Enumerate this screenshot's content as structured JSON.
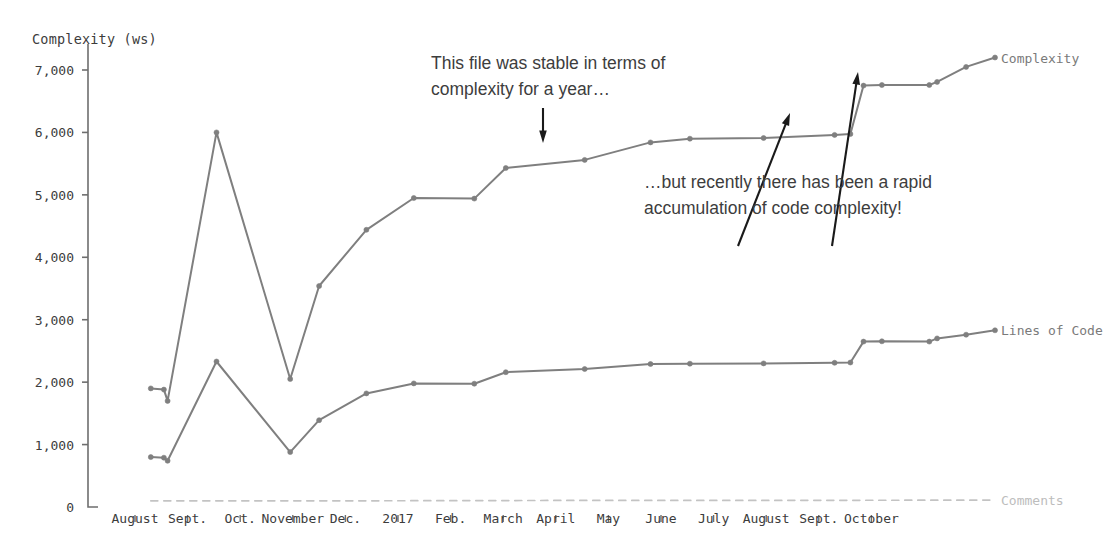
{
  "chart_data": {
    "type": "line",
    "title": "",
    "ylabel": "Complexity (ws)",
    "xlabel": "",
    "ylim": [
      0,
      7600
    ],
    "yticks": [
      0,
      1000,
      2000,
      3000,
      4000,
      5000,
      6000,
      7000
    ],
    "ytick_labels": [
      "0",
      "1,000",
      "2,000",
      "3,000",
      "4,000",
      "5,000",
      "6,000",
      "7,000"
    ],
    "categories": [
      "August",
      "Sept.",
      "Oct.",
      "November",
      "Dec.",
      "2017",
      "Feb.",
      "March",
      "April",
      "May",
      "June",
      "July",
      "August",
      "Sept.",
      "October"
    ],
    "grid": false,
    "legend_position": "right-inline",
    "series": [
      {
        "name": "Complexity",
        "color": "#7f7f7f",
        "style": "solid",
        "markers": true,
        "points": [
          {
            "x": 0.3,
            "y": 1900
          },
          {
            "x": 0.55,
            "y": 1880
          },
          {
            "x": 0.62,
            "y": 1700
          },
          {
            "x": 1.55,
            "y": 6000
          },
          {
            "x": 2.95,
            "y": 2050
          },
          {
            "x": 3.5,
            "y": 3540
          },
          {
            "x": 4.4,
            "y": 4440
          },
          {
            "x": 5.3,
            "y": 4950
          },
          {
            "x": 6.45,
            "y": 4940
          },
          {
            "x": 7.05,
            "y": 5430
          },
          {
            "x": 8.55,
            "y": 5560
          },
          {
            "x": 9.8,
            "y": 5840
          },
          {
            "x": 10.55,
            "y": 5900
          },
          {
            "x": 11.95,
            "y": 5910
          },
          {
            "x": 13.3,
            "y": 5960
          },
          {
            "x": 13.6,
            "y": 5975
          },
          {
            "x": 13.85,
            "y": 6750
          },
          {
            "x": 14.2,
            "y": 6760
          },
          {
            "x": 15.1,
            "y": 6760
          },
          {
            "x": 15.25,
            "y": 6810
          },
          {
            "x": 15.8,
            "y": 7050
          },
          {
            "x": 16.35,
            "y": 7200
          }
        ]
      },
      {
        "name": "Lines of Code",
        "color": "#7f7f7f",
        "style": "solid",
        "markers": true,
        "points": [
          {
            "x": 0.3,
            "y": 800
          },
          {
            "x": 0.55,
            "y": 790
          },
          {
            "x": 0.62,
            "y": 740
          },
          {
            "x": 1.55,
            "y": 2330
          },
          {
            "x": 2.95,
            "y": 880
          },
          {
            "x": 3.5,
            "y": 1390
          },
          {
            "x": 4.4,
            "y": 1820
          },
          {
            "x": 5.3,
            "y": 1980
          },
          {
            "x": 6.45,
            "y": 1975
          },
          {
            "x": 7.05,
            "y": 2160
          },
          {
            "x": 8.55,
            "y": 2210
          },
          {
            "x": 9.8,
            "y": 2290
          },
          {
            "x": 10.55,
            "y": 2295
          },
          {
            "x": 11.95,
            "y": 2300
          },
          {
            "x": 13.3,
            "y": 2310
          },
          {
            "x": 13.6,
            "y": 2315
          },
          {
            "x": 13.85,
            "y": 2650
          },
          {
            "x": 14.2,
            "y": 2655
          },
          {
            "x": 15.1,
            "y": 2650
          },
          {
            "x": 15.25,
            "y": 2700
          },
          {
            "x": 15.8,
            "y": 2760
          },
          {
            "x": 16.35,
            "y": 2830
          }
        ]
      },
      {
        "name": "Comments",
        "color": "#c3c3c3",
        "style": "dashed",
        "markers": false,
        "points": [
          {
            "x": 0.3,
            "y": 100
          },
          {
            "x": 4.4,
            "y": 100
          },
          {
            "x": 8.55,
            "y": 105
          },
          {
            "x": 12.0,
            "y": 105
          },
          {
            "x": 16.35,
            "y": 110
          }
        ]
      }
    ],
    "annotations": [
      {
        "id": "stable-note",
        "lines": [
          "This file was stable in terms of",
          "complexity for a year…"
        ],
        "arrow": {
          "from": [
            543,
            108
          ],
          "to": [
            543,
            143
          ]
        }
      },
      {
        "id": "rapid-note",
        "lines": [
          "…but recently there has been a rapid",
          "accumulation of code complexity!"
        ],
        "arrow": {
          "from": [
            738,
            246
          ],
          "to": [
            790,
            113
          ]
        }
      },
      {
        "id": "rapid-note-arrow2",
        "lines": [],
        "arrow": {
          "from": [
            832,
            246
          ],
          "to": [
            858,
            72
          ]
        }
      }
    ]
  }
}
